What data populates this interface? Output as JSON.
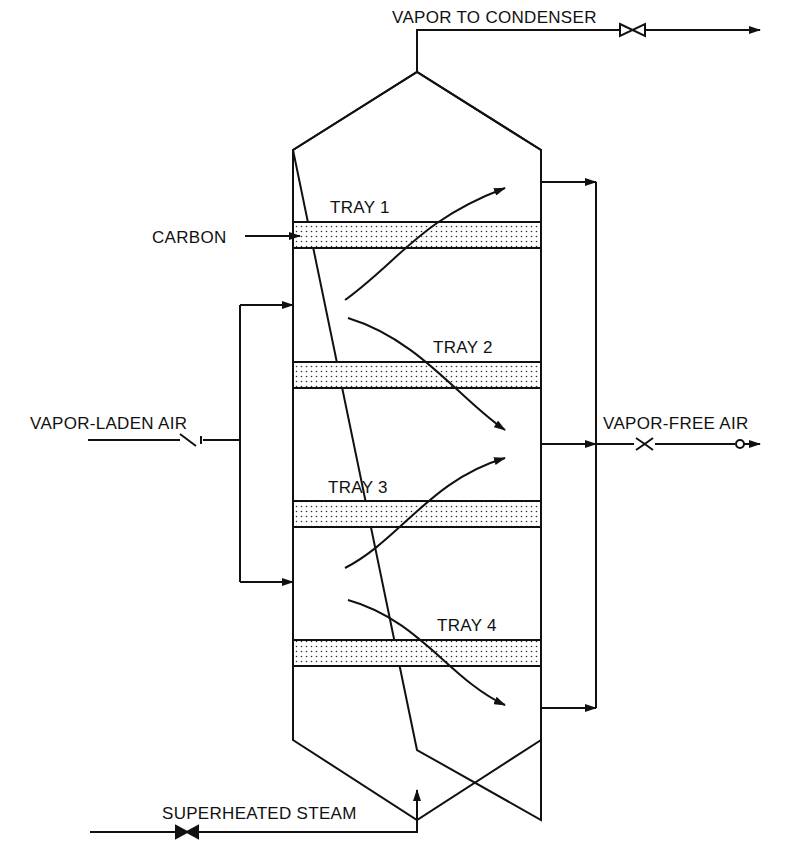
{
  "labels": {
    "vapor_to_condenser": "VAPOR TO CONDENSER",
    "carbon": "CARBON",
    "tray1": "TRAY 1",
    "tray2": "TRAY 2",
    "tray3": "TRAY 3",
    "tray4": "TRAY 4",
    "vapor_laden_air": "VAPOR-LADEN AIR",
    "vapor_free_air": "VAPOR-FREE AIR",
    "superheated_steam": "SUPERHEATED STEAM"
  },
  "colors": {
    "line": "#111111",
    "tray_fill": "#e8e8e8"
  }
}
